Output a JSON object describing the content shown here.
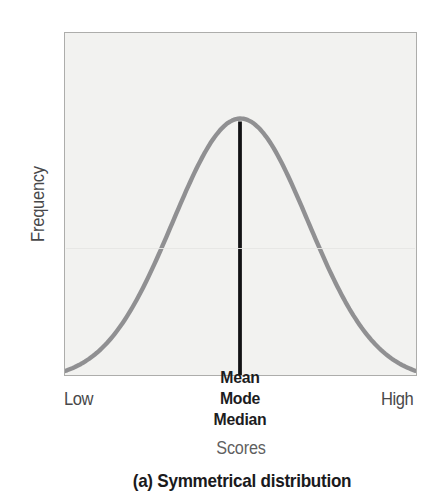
{
  "figure": {
    "ylabel": "Frequency",
    "xlabel": "Scores",
    "x_min_label": "Low",
    "x_max_label": "High",
    "peak_labels": [
      "Mean",
      "Mode",
      "Median"
    ],
    "caption": "(a) Symmetrical distribution"
  },
  "chart_data": {
    "type": "line",
    "subtype": "normal-distribution-density",
    "title": "",
    "xlabel": "Scores",
    "ylabel": "Frequency",
    "x_tick_labels": [
      "Low",
      "High"
    ],
    "y_tick_labels": [],
    "grid": false,
    "legend": false,
    "series": [
      {
        "name": "symmetrical-distribution-curve",
        "shape": "gaussian",
        "mean_sd_units": 0,
        "sd_units": 1,
        "x_range_sd": [
          -2.6,
          2.6
        ]
      }
    ],
    "annotations": [
      {
        "type": "vline",
        "x_sd": 0,
        "labels": [
          "Mean",
          "Mode",
          "Median"
        ],
        "meaning": "mean, mode and median coincide at the center of a symmetrical distribution"
      }
    ],
    "caption": "(a) Symmetrical distribution"
  },
  "colors": {
    "curve": "#909092",
    "center_line": "#121214",
    "plot_bg": "#f2f2f0",
    "plot_border": "#adadab",
    "axis_text": "#48484a",
    "muted_text": "#5f5f61",
    "bold_text": "#1a1a1c",
    "page_bg": "#ffffff"
  }
}
